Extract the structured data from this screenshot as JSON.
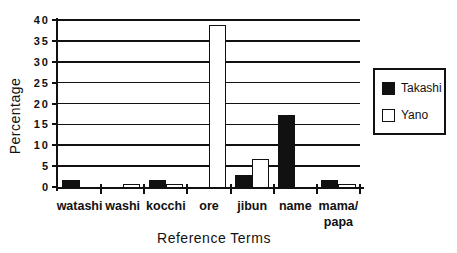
{
  "chart_data": {
    "type": "bar",
    "title": "",
    "xlabel": "Reference Terms",
    "ylabel": "Percentage",
    "categories": [
      "watashi",
      "washi",
      "kocchi",
      "ore",
      "jibun",
      "name",
      "mama/\npapa"
    ],
    "series": [
      {
        "name": "Takashi",
        "fill": "#111111",
        "style": "filled",
        "values": [
          2,
          0,
          2,
          0,
          3,
          17.5,
          2
        ]
      },
      {
        "name": "Yano",
        "fill": "#ffffff",
        "style": "outlined",
        "values": [
          0,
          1,
          1,
          39,
          7,
          0,
          1
        ]
      }
    ],
    "ylim": [
      0,
      40
    ],
    "yticks": [
      0,
      5,
      10,
      15,
      20,
      25,
      30,
      35,
      40
    ],
    "grid": true,
    "legend_position": "right",
    "colors": {
      "ink": "#111111",
      "background": "#ffffff"
    }
  }
}
